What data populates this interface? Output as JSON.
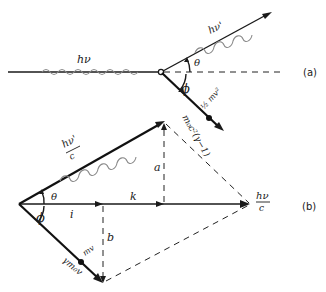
{
  "figure": {
    "panel_a": {
      "label": "(a)",
      "incident_photon": {
        "label": "hν"
      },
      "scattered_photon": {
        "label": "hν'"
      },
      "scatter_angle": {
        "label": "θ"
      },
      "recoil_angle": {
        "label": "ϕ"
      },
      "electron_energy_top": {
        "label": "½ mv²"
      },
      "electron_energy_bottom": {
        "label": "m₀c²(γ−1)"
      }
    },
    "panel_b": {
      "label": "(b)",
      "scattered_momentum": {
        "label_num": "hν'",
        "label_den": "c"
      },
      "incident_momentum": {
        "label_num": "hν",
        "label_den": "c"
      },
      "electron_momentum": {
        "label_top": "mv",
        "label_bottom": "γm₀v"
      },
      "angle_theta": "θ",
      "angle_phi": "ϕ",
      "unit_i": "i",
      "unit_k": "k",
      "component_a": "a",
      "component_b": "b"
    },
    "colors": {
      "line": "#1a1a1a",
      "wave": "#8a8a8a",
      "background": "#ffffff"
    }
  }
}
